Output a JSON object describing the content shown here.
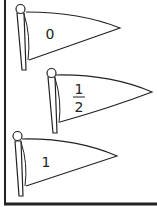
{
  "worksheet": {
    "flags": [
      {
        "label": "0",
        "kind": "whole"
      },
      {
        "label_numerator": "1",
        "label_denominator": "2",
        "kind": "fraction"
      },
      {
        "label": "1",
        "kind": "whole"
      }
    ]
  },
  "colors": {
    "stroke": "#222222",
    "background": "#ffffff"
  }
}
